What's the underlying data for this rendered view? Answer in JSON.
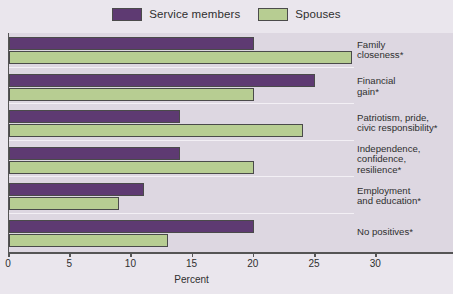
{
  "chart_data": {
    "type": "bar",
    "orientation": "horizontal",
    "title": "",
    "xlabel": "Percent",
    "ylabel": "",
    "xlim": [
      0,
      36
    ],
    "xticks": [
      0,
      5,
      10,
      15,
      20,
      25,
      30
    ],
    "xtick_labels": [
      "0",
      "5",
      "10",
      "15",
      "20",
      "25",
      "30"
    ],
    "grid": false,
    "legend_position": "top-center",
    "categories": [
      "Family closeness*",
      "Financial gain*",
      "Patriotism, pride, civic responsibility*",
      "Independence, confidence, resilience*",
      "Employment and education*",
      "No positives*"
    ],
    "category_lines": [
      [
        "Family",
        "closeness*"
      ],
      [
        "Financial",
        "gain*"
      ],
      [
        "Patriotism, pride,",
        "civic responsibility*"
      ],
      [
        "Independence,",
        "confidence,",
        "resilience*"
      ],
      [
        "Employment",
        "and education*"
      ],
      [
        "No positives*"
      ]
    ],
    "series": [
      {
        "name": "Service members",
        "color": "#5e3a72",
        "values": [
          20,
          25,
          14,
          14,
          11,
          20
        ]
      },
      {
        "name": "Spouses",
        "color": "#b7cd92",
        "values": [
          28,
          20,
          24,
          20,
          9,
          13
        ]
      }
    ]
  },
  "legend": {
    "items": [
      {
        "label": "Service members",
        "swatch": "service-members-swatch"
      },
      {
        "label": "Spouses",
        "swatch": "spouses-swatch"
      }
    ]
  },
  "axis": {
    "x_title": "Percent"
  },
  "colors": {
    "service_members": "#5e3a72",
    "spouses": "#b7cd92",
    "plot_background": "#ddd7e1",
    "figure_background": "#eae6ed",
    "axis": "#555555"
  }
}
